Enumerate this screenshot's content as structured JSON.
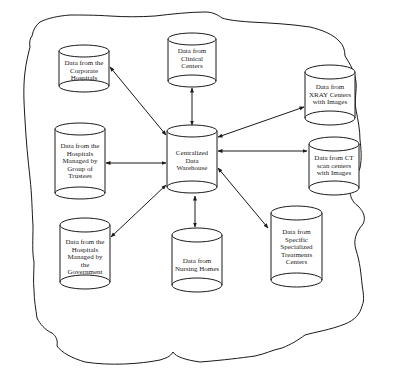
{
  "diagram": {
    "type": "hub-and-spoke data flow",
    "colors": {
      "stroke": "#1a1a1a",
      "background": "#ffffff"
    },
    "hub": {
      "id": "warehouse",
      "label": "Centralized\nData\nWarehouse"
    },
    "nodes": [
      {
        "id": "corporate",
        "label": "Data from the\nCorporate\nHospitals"
      },
      {
        "id": "clinical",
        "label": "Data from\nClinical\nCenters"
      },
      {
        "id": "xray",
        "label": "Data from\nXRAY Centers\nwith Images"
      },
      {
        "id": "trustees",
        "label": "Data from the\nHospitals\nManaged by\nGroup of\nTrustees"
      },
      {
        "id": "ct",
        "label": "Data from CT\nscan centers\nwith Images"
      },
      {
        "id": "government",
        "label": "Data from the\nHospitals\nManaged by\nthe\nGovernment"
      },
      {
        "id": "nursing",
        "label": "Data from\nNursing Homes"
      },
      {
        "id": "specialized",
        "label": "Data from\nSpecific\nSpecialized\nTreatments\nCenters"
      }
    ],
    "edges": [
      {
        "from": "warehouse",
        "to": "corporate",
        "bidirectional": true
      },
      {
        "from": "warehouse",
        "to": "clinical",
        "bidirectional": true
      },
      {
        "from": "warehouse",
        "to": "xray",
        "bidirectional": true
      },
      {
        "from": "warehouse",
        "to": "trustees",
        "bidirectional": true
      },
      {
        "from": "warehouse",
        "to": "ct",
        "bidirectional": true
      },
      {
        "from": "warehouse",
        "to": "government",
        "bidirectional": true
      },
      {
        "from": "warehouse",
        "to": "nursing",
        "bidirectional": true
      },
      {
        "from": "warehouse",
        "to": "specialized",
        "bidirectional": true
      }
    ],
    "boundary": "hand-drawn cloud outline enclosing all nodes"
  }
}
